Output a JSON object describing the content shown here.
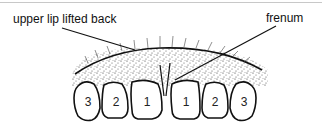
{
  "labels": {
    "upper_lip": "upper lip lifted back",
    "frenum": "frenum"
  },
  "teeth": [
    {
      "position": "left-canine",
      "number": "3"
    },
    {
      "position": "left-lateral-incisor",
      "number": "2"
    },
    {
      "position": "left-central-incisor",
      "number": "1"
    },
    {
      "position": "right-central-incisor",
      "number": "1"
    },
    {
      "position": "right-lateral-incisor",
      "number": "2"
    },
    {
      "position": "right-canine",
      "number": "3"
    }
  ],
  "colors": {
    "ink": "#111111",
    "background": "#ffffff",
    "border_line": "#c8c8c8"
  }
}
